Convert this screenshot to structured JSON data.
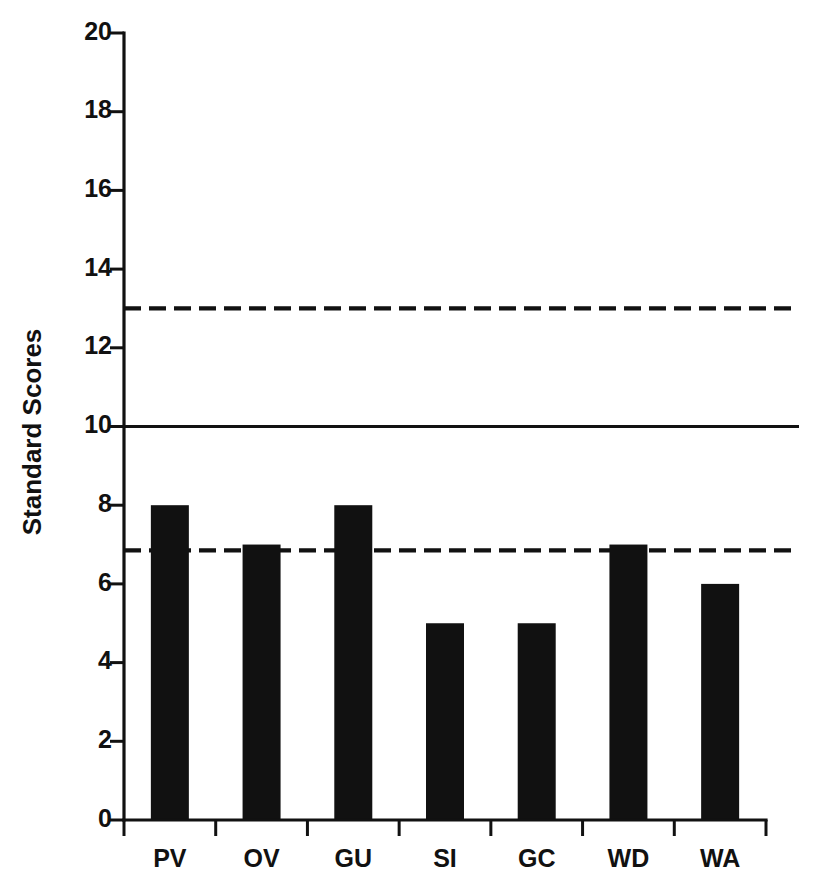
{
  "chart_data": {
    "type": "bar",
    "title": "",
    "subtitle": "",
    "xlabel": "",
    "ylabel": "Standard Scores",
    "categories": [
      "PV",
      "OV",
      "GU",
      "SI",
      "GC",
      "WD",
      "WA"
    ],
    "values": [
      8,
      7,
      8,
      5,
      5,
      7,
      6
    ],
    "series": [
      {
        "name": "Standard Score",
        "values": [
          8,
          7,
          8,
          5,
          5,
          7,
          6
        ]
      }
    ],
    "ylim": [
      0,
      20
    ],
    "ytick_labels": [
      "0",
      "2",
      "4",
      "6",
      "8",
      "10",
      "12",
      "14",
      "16",
      "18",
      "20"
    ],
    "ytick_values": [
      0,
      2,
      4,
      6,
      8,
      10,
      12,
      14,
      16,
      18,
      20
    ],
    "grid": false,
    "legend": "none",
    "bar_color": "#111111",
    "axis_color": "#111111",
    "background_color": "#ffffff",
    "reference_lines": [
      {
        "name": "upper-reference-line",
        "value": 13.0,
        "style": "dashed",
        "color": "#111111"
      },
      {
        "name": "mean-reference-line",
        "value": 10.0,
        "style": "solid",
        "color": "#111111"
      },
      {
        "name": "lower-reference-line",
        "value": 6.85,
        "style": "dashed",
        "color": "#111111"
      }
    ]
  },
  "axis": {
    "y_title": "Standard Scores"
  }
}
